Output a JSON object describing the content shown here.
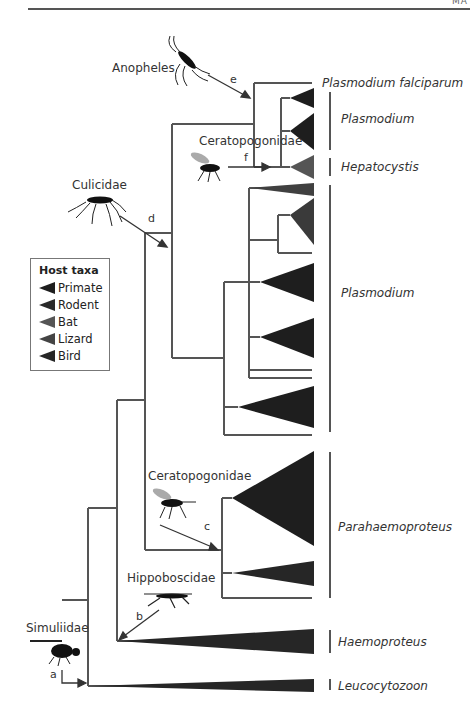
{
  "header": {
    "corner_text": "MA"
  },
  "vectors": [
    {
      "id": "a",
      "name": "Simuliidae"
    },
    {
      "id": "b",
      "name": "Hippoboscidae"
    },
    {
      "id": "c",
      "name": "Ceratopogonidae"
    },
    {
      "id": "d",
      "name": "Culicidae"
    },
    {
      "id": "e",
      "name": "Anopheles"
    },
    {
      "id": "f",
      "name": "Ceratopogonidae"
    }
  ],
  "taxa": {
    "plasmodium_falciparum": "Plasmodium falciparum",
    "plasmodium_top": "Plasmodium",
    "hepatocystis": "Hepatocystis",
    "plasmodium_mid": "Plasmodium",
    "parahaemoproteus": "Parahaemoproteus",
    "haemoproteus": "Haemoproteus",
    "leucocytozoon": "Leucocytozoon"
  },
  "legend": {
    "title": "Host taxa",
    "items": [
      {
        "label": "Primate",
        "color": "#1e1e1e"
      },
      {
        "label": "Rodent",
        "color": "#2a2a2a"
      },
      {
        "label": "Bat",
        "color": "#555555"
      },
      {
        "label": "Lizard",
        "color": "#444444"
      },
      {
        "label": "Bird",
        "color": "#262626"
      }
    ]
  },
  "colors": {
    "branch": "#555555",
    "clade_dark": "#1e1e1e",
    "clade_bat": "#555555",
    "clade_lizard": "#404040"
  }
}
